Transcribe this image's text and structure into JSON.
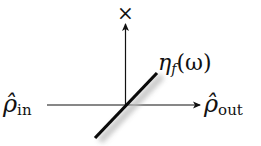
{
  "diagram": {
    "type": "beam-splitter",
    "labels": {
      "input": "ρ̂",
      "input_sub": "in",
      "output": "ρ̂",
      "output_sub": "out",
      "splitter": "η",
      "splitter_sub": "f",
      "splitter_arg": "(ω)",
      "discard": "×"
    },
    "colors": {
      "line": "#111111",
      "splitter": "#0a0a0a",
      "shadow": "#bbbbbb"
    }
  }
}
